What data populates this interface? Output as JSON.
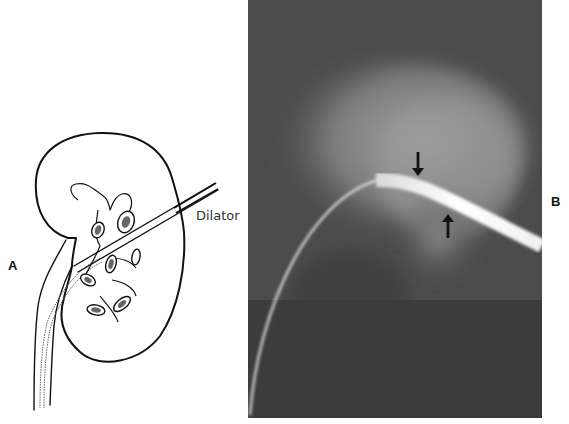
{
  "figure": {
    "panels": [
      {
        "id": "A",
        "label": "A",
        "type": "line-illustration",
        "subject": "kidney with collecting system, ureter, and dilator inserted percutaneously",
        "callouts": [
          {
            "text": "Dilator"
          }
        ]
      },
      {
        "id": "B",
        "label": "B",
        "type": "radiograph",
        "subject": "fluoroscopic image of curved wire/dilator track with two arrows marking the narrowing",
        "annotations": [
          {
            "kind": "arrow",
            "direction": "down"
          },
          {
            "kind": "arrow",
            "direction": "up"
          }
        ]
      }
    ]
  },
  "colors": {
    "background": "#ffffff",
    "line_art": "#111111",
    "radiograph_dark": "#3a3a3a",
    "radiograph_mid": "#6e6e6e",
    "radiograph_light": "#9a9a9a",
    "dilator_bright": "#f2f2f2"
  }
}
